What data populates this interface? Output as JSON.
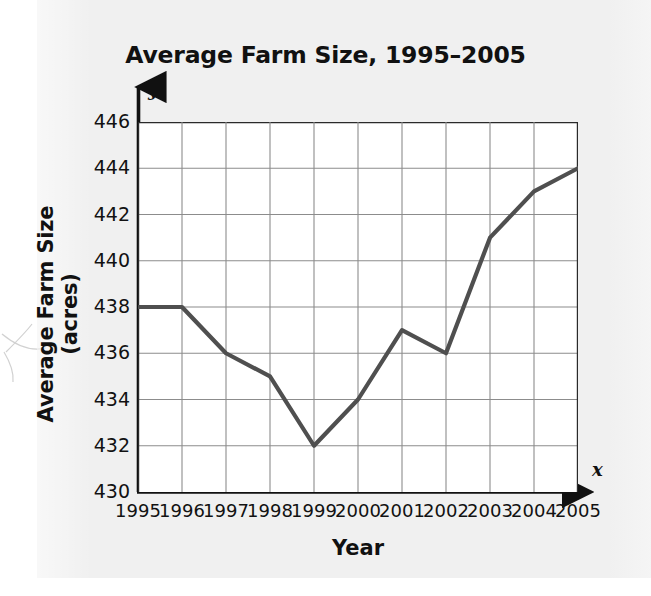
{
  "figure": {
    "background_color": "#f0f0f0",
    "plot_background_color": "#ffffff",
    "grid_color": "#8c8c8c",
    "axis_color": "#111111",
    "line_color": "#4f4f4f"
  },
  "axis_symbols": {
    "y_variable": "y",
    "x_variable": "x"
  },
  "chart_data": {
    "type": "line",
    "title": "Average Farm Size, 1995–2005",
    "xlabel": "Year",
    "ylabel": "Average Farm Size (acres)",
    "categories": [
      "1995",
      "1996",
      "1997",
      "1998",
      "1999",
      "2000",
      "2001",
      "2002",
      "2003",
      "2004",
      "2005"
    ],
    "x": [
      1995,
      1996,
      1997,
      1998,
      1999,
      2000,
      2001,
      2002,
      2003,
      2004,
      2005
    ],
    "values": [
      438,
      438,
      436,
      435,
      432,
      434,
      437,
      436,
      441,
      443,
      444
    ],
    "ytick_labels": [
      "430",
      "432",
      "434",
      "436",
      "438",
      "440",
      "442",
      "444",
      "446"
    ],
    "yticks": [
      430,
      432,
      434,
      436,
      438,
      440,
      442,
      444,
      446
    ],
    "ylim": [
      430,
      446
    ],
    "xlim": [
      1995,
      2005
    ],
    "grid": true,
    "legend": "none",
    "series": [
      {
        "name": "Average Farm Size (acres)",
        "values": [
          438,
          438,
          436,
          435,
          432,
          434,
          437,
          436,
          441,
          443,
          444
        ]
      }
    ]
  }
}
